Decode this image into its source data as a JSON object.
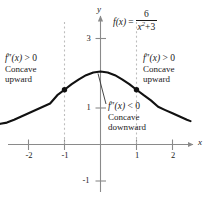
{
  "chart_data": {
    "type": "line",
    "title": "",
    "function_label": {
      "lhs": "f(x)",
      "equals": "=",
      "numerator": "6",
      "denominator_base": "x",
      "denominator_exp": "2",
      "denominator_op": "+",
      "denominator_const": "3",
      "plain": "f(x) = 6/(x^2 + 3)"
    },
    "xlabel": "x",
    "ylabel": "y",
    "xlim": [
      -2.78,
      2.5
    ],
    "ylim": [
      -1.55,
      3.7
    ],
    "x_ticks": [
      "-2",
      "-1",
      "1",
      "2"
    ],
    "x_tick_values": [
      -2,
      -1,
      1,
      2
    ],
    "y_ticks": [
      "3",
      "1",
      "-1"
    ],
    "y_tick_values": [
      3,
      1,
      -1
    ],
    "grid": false,
    "legend": "none",
    "curve_color": "#111111",
    "axis_color": "#8a8a8a",
    "dash_color": "#b8b8b8",
    "inflection_points": [
      {
        "x": -1,
        "y": 1.5
      },
      {
        "x": 1,
        "y": 1.5
      }
    ],
    "maximum_point": {
      "x": 0,
      "y": 2
    },
    "series": [
      {
        "name": "f(x) = 6/(x^2+3)",
        "x": [
          -2.78,
          -2.6,
          -2.4,
          -2.2,
          -2.0,
          -1.8,
          -1.6,
          -1.4,
          -1.2,
          -1.0,
          -0.8,
          -0.6,
          -0.4,
          -0.2,
          0,
          0.2,
          0.4,
          0.6,
          0.8,
          1.0,
          1.2,
          1.4,
          1.6,
          1.8,
          2.0,
          2.2,
          2.4,
          2.5
        ],
        "y": [
          0.566,
          0.6,
          0.678,
          0.766,
          0.857,
          0.943,
          1.034,
          1.124,
          1.351,
          1.5,
          1.653,
          1.786,
          1.899,
          1.974,
          2.0,
          1.974,
          1.899,
          1.786,
          1.653,
          1.5,
          1.351,
          1.209,
          1.034,
          0.943,
          0.857,
          0.766,
          0.678,
          0.64
        ]
      }
    ]
  },
  "annotations": {
    "left": {
      "math_fn": "f",
      "math_primes": "″",
      "math_arg": "(x)",
      "math_rel": " > 0",
      "line2": "Concave",
      "line3": "upward"
    },
    "right": {
      "math_fn": "f",
      "math_primes": "″",
      "math_arg": "(x)",
      "math_rel": " > 0",
      "line2": "Concave",
      "line3": "upward"
    },
    "center": {
      "math_fn": "f",
      "math_primes": "″",
      "math_arg": "(x)",
      "math_rel": " < 0",
      "line2": "Concave",
      "line3": "downward"
    }
  }
}
